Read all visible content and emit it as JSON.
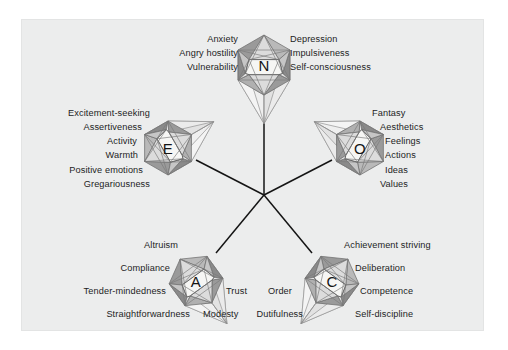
{
  "figure": {
    "background_color": "#ffffff",
    "panel_color": "#eceded",
    "line_color": "#1a1a1a",
    "facet_colors": {
      "lightest": "#f0f0f0",
      "light": "#dcdcdc",
      "mid": "#b9b9b9",
      "dark": "#9a9a9a",
      "darkest": "#8a8a8a",
      "edge": "#6f6f6f",
      "core": "#f4f4f2"
    }
  },
  "nodes": [
    {
      "id": "N",
      "letter": "N",
      "name": "neuroticism",
      "labels_left": [
        "Anxiety",
        "Angry hostility",
        "Vulnerability"
      ],
      "labels_right": [
        "Depression",
        "Impulsiveness",
        "Self-consciousness"
      ]
    },
    {
      "id": "E",
      "letter": "E",
      "name": "extraversion",
      "labels_left": [
        "Excitement-seeking",
        "Assertiveness",
        "Activity",
        "Warmth",
        "Positive emotions",
        "Gregariousness"
      ],
      "labels_right": []
    },
    {
      "id": "O",
      "letter": "O",
      "name": "openness",
      "labels_left": [],
      "labels_right": [
        "Fantasy",
        "Aesthetics",
        "Feelings",
        "Actions",
        "Ideas",
        "Values"
      ]
    },
    {
      "id": "A",
      "letter": "A",
      "name": "agreeableness",
      "labels_left": [
        "Altruism",
        "Compliance",
        "Tender-mindedness",
        "Straightforwardness"
      ],
      "labels_right": [
        "Trust",
        "Modesty"
      ]
    },
    {
      "id": "C",
      "letter": "C",
      "name": "conscientiousness",
      "labels_left": [
        "Order",
        "Dutifulness"
      ],
      "labels_right": [
        "Achievement striving",
        "Deliberation",
        "Competence",
        "Self-discipline"
      ]
    }
  ]
}
